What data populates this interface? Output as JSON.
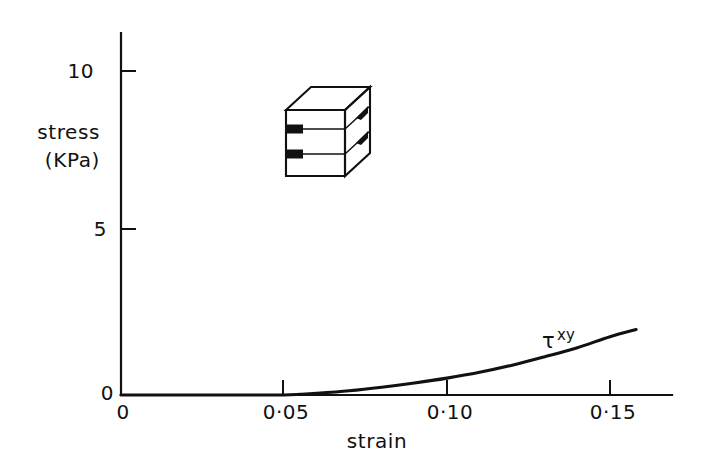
{
  "chart_data": {
    "type": "line",
    "title": "",
    "subtitle": "",
    "xlabel": "strain",
    "ylabel_line1": "stress",
    "ylabel_line2": "(KPa)",
    "xlim": [
      0,
      0.17
    ],
    "ylim": [
      0,
      11.2
    ],
    "grid": false,
    "legend_position": "inline-annotation",
    "x_tick_labels": [
      "0",
      "0·05",
      "0·10",
      "0·15"
    ],
    "x_tick_values": [
      0,
      0.05,
      0.1,
      0.15
    ],
    "y_tick_labels": [
      "0",
      "5",
      "10"
    ],
    "y_tick_values": [
      0,
      5,
      10
    ],
    "series": [
      {
        "name": "τ",
        "name_superscript": "xy",
        "annotation_text": "τ",
        "annotation_superscript": "xy",
        "x": [
          0.0,
          0.01,
          0.02,
          0.03,
          0.04,
          0.05,
          0.055,
          0.06,
          0.07,
          0.08,
          0.09,
          0.1,
          0.11,
          0.12,
          0.13,
          0.14,
          0.15,
          0.158
        ],
        "values": [
          0.0,
          0.0,
          0.0,
          0.0,
          0.0,
          0.0,
          0.02,
          0.05,
          0.13,
          0.24,
          0.37,
          0.52,
          0.7,
          0.92,
          1.18,
          1.46,
          1.8,
          2.02
        ]
      }
    ],
    "annotations": [
      {
        "name": "shear-block-diagram",
        "type": "isometric-box",
        "description": "3D rectangular block divided into three horizontal layers with right-pointing shear arrows on the left face and right face"
      }
    ],
    "colors": {
      "ink": "#111111",
      "background": "#ffffff"
    }
  },
  "labels": {
    "y_axis_title_line1": "stress",
    "y_axis_title_line2": "(KPa)",
    "x_axis_title": "strain",
    "y_tick_10": "10",
    "y_tick_5": "5",
    "y_tick_0": "0",
    "x_tick_0": "0",
    "x_tick_005": "0·05",
    "x_tick_010": "0·10",
    "x_tick_015": "0·15",
    "curve_tau": "τ",
    "curve_tau_sup": "xy"
  }
}
